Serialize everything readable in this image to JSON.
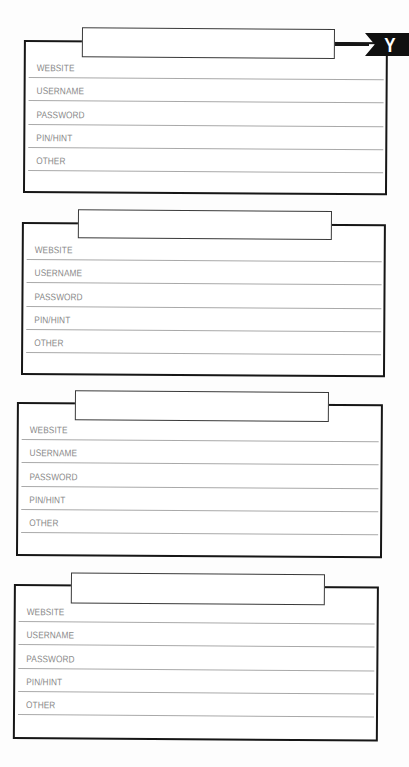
{
  "page": {
    "type": "password logbook page",
    "letter_tab": "Y",
    "colors": {
      "border": "#161616",
      "rule_line": "#a9a9a9",
      "label_text": "#8a8a8a",
      "tab_background": "#101010",
      "tab_text": "#ffffff"
    }
  },
  "entries": [
    {
      "title": "",
      "fields": [
        {
          "label": "WEBSITE",
          "value": ""
        },
        {
          "label": "USERNAME",
          "value": ""
        },
        {
          "label": "PASSWORD",
          "value": ""
        },
        {
          "label": "PIN/HINT",
          "value": ""
        },
        {
          "label": "OTHER",
          "value": ""
        },
        {
          "label": "",
          "value": ""
        }
      ]
    },
    {
      "title": "",
      "fields": [
        {
          "label": "WEBSITE",
          "value": ""
        },
        {
          "label": "USERNAME",
          "value": ""
        },
        {
          "label": "PASSWORD",
          "value": ""
        },
        {
          "label": "PIN/HINT",
          "value": ""
        },
        {
          "label": "OTHER",
          "value": ""
        },
        {
          "label": "",
          "value": ""
        }
      ]
    },
    {
      "title": "",
      "fields": [
        {
          "label": "WEBSITE",
          "value": ""
        },
        {
          "label": "USERNAME",
          "value": ""
        },
        {
          "label": "PASSWORD",
          "value": ""
        },
        {
          "label": "PIN/HINT",
          "value": ""
        },
        {
          "label": "OTHER",
          "value": ""
        },
        {
          "label": "",
          "value": ""
        }
      ]
    },
    {
      "title": "",
      "fields": [
        {
          "label": "WEBSITE",
          "value": ""
        },
        {
          "label": "USERNAME",
          "value": ""
        },
        {
          "label": "PASSWORD",
          "value": ""
        },
        {
          "label": "PIN/HINT",
          "value": ""
        },
        {
          "label": "OTHER",
          "value": ""
        },
        {
          "label": "",
          "value": ""
        }
      ]
    }
  ]
}
